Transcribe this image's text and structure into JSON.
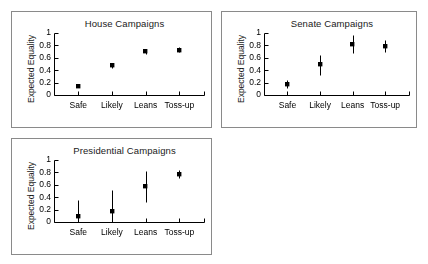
{
  "figure": {
    "ylabel": "Expected Equality",
    "ytick_labels": [
      "0",
      "0.2",
      "0.4",
      "0.6",
      "0.8",
      "1"
    ],
    "xtick_labels": [
      "Safe",
      "Likely",
      "Leans",
      "Toss-up"
    ],
    "panel_border_color": "#8a8a8a",
    "marker_color": "#000000",
    "axis_color": "#000000",
    "background_color": "#ffffff"
  },
  "panels": [
    {
      "id": "house",
      "title": "House Campaigns"
    },
    {
      "id": "senate",
      "title": "Senate Campaigns"
    },
    {
      "id": "president",
      "title": "Presidential Campaigns"
    }
  ],
  "chart_data": [
    {
      "type": "scatter",
      "title": "House Campaigns",
      "xlabel": "",
      "ylabel": "Expected Equality",
      "ylim": [
        0,
        1
      ],
      "yticks": [
        0,
        0.2,
        0.4,
        0.6,
        0.8,
        1
      ],
      "grid": false,
      "legend": "none",
      "categories": [
        "Safe",
        "Likely",
        "Leans",
        "Toss-up"
      ],
      "values": [
        0.15,
        0.48,
        0.7,
        0.73
      ],
      "error_low": [
        0.13,
        0.44,
        0.66,
        0.69
      ],
      "error_high": [
        0.17,
        0.52,
        0.74,
        0.77
      ]
    },
    {
      "type": "scatter",
      "title": "Senate Campaigns",
      "xlabel": "",
      "ylabel": "Expected Equality",
      "ylim": [
        0,
        1
      ],
      "yticks": [
        0,
        0.2,
        0.4,
        0.6,
        0.8,
        1
      ],
      "grid": false,
      "legend": "none",
      "categories": [
        "Safe",
        "Likely",
        "Leans",
        "Toss-up"
      ],
      "values": [
        0.18,
        0.49,
        0.82,
        0.79
      ],
      "error_low": [
        0.12,
        0.32,
        0.67,
        0.7
      ],
      "error_high": [
        0.25,
        0.65,
        0.97,
        0.88
      ]
    },
    {
      "type": "scatter",
      "title": "Presidential Campaigns",
      "xlabel": "",
      "ylabel": "Expected Equality",
      "ylim": [
        0,
        1
      ],
      "yticks": [
        0,
        0.2,
        0.4,
        0.6,
        0.8,
        1
      ],
      "grid": false,
      "legend": "none",
      "categories": [
        "Safe",
        "Likely",
        "Leans",
        "Toss-up"
      ],
      "values": [
        0.1,
        0.17,
        0.58,
        0.77
      ],
      "error_low": [
        0.0,
        0.0,
        0.33,
        0.71
      ],
      "error_high": [
        0.35,
        0.51,
        0.83,
        0.84
      ]
    }
  ]
}
